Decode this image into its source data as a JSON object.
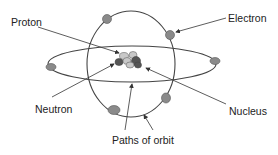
{
  "diagram": {
    "type": "atom-structure",
    "labels": {
      "proton": "Proton",
      "electron": "Electron",
      "neutron": "Neutron",
      "nucleus": "Nucleus",
      "paths": "Paths of orbit"
    },
    "colors": {
      "line": "#444444",
      "electron": "#8a8a8a",
      "proton": "#c8c8c8",
      "neutron": "#555555"
    },
    "electron_count": 6,
    "orbit_count": 2
  }
}
